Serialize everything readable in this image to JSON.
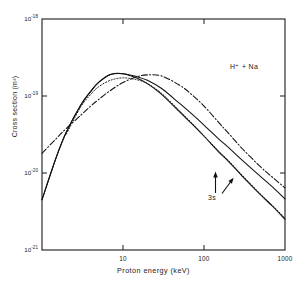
{
  "chart_data": {
    "type": "line",
    "title": "",
    "xlabel": "Proton energy (keV)",
    "ylabel": "Cross section (m²)",
    "xscale": "log",
    "yscale": "log",
    "xlim": [
      1,
      1000
    ],
    "ylim": [
      1e-21,
      1e-18
    ],
    "grid": false,
    "legend": "none",
    "xticks": [
      {
        "value": 10,
        "label": "10"
      },
      {
        "value": 100,
        "label": "100"
      },
      {
        "value": 1000,
        "label": "1000"
      }
    ],
    "yticks": [
      {
        "value": 1e-18,
        "mantissa": "10",
        "exponent": "-18"
      },
      {
        "value": 1e-19,
        "mantissa": "10",
        "exponent": "-19"
      },
      {
        "value": 1e-20,
        "mantissa": "10",
        "exponent": "-20"
      },
      {
        "value": 1e-21,
        "mantissa": "10",
        "exponent": "-21"
      }
    ],
    "annotations": [
      {
        "name": "reaction-label",
        "text": "H⁺ + Na",
        "x": 230,
        "y": 63
      },
      {
        "name": "state-label",
        "text": "3s",
        "x": 180,
        "y": 300
      }
    ],
    "series": [
      {
        "name": "solid-curve-1",
        "style": "solid",
        "x": [
          1,
          1.5,
          2,
          3,
          4,
          5,
          7,
          10,
          15,
          20,
          30,
          50,
          70,
          100,
          150,
          200,
          300,
          500,
          700,
          1000
        ],
        "y": [
          4.5e-21,
          1.6e-20,
          3.4e-20,
          7.6e-20,
          1.15e-19,
          1.5e-19,
          1.9e-19,
          1.95e-19,
          1.7e-19,
          1.45e-19,
          1.05e-19,
          6.2e-20,
          4.4e-20,
          3e-20,
          1.9e-20,
          1.42e-20,
          9e-21,
          5.2e-21,
          3.7e-21,
          2.5e-21
        ]
      },
      {
        "name": "solid-curve-2",
        "style": "solid",
        "x": [
          1,
          1.5,
          2,
          3,
          4,
          5,
          7,
          10,
          15,
          20,
          30,
          50,
          70,
          100,
          150,
          200,
          300,
          500,
          700,
          1000
        ],
        "y": [
          4.5e-21,
          1.6e-20,
          3.4e-20,
          7.6e-20,
          1.15e-19,
          1.5e-19,
          1.9e-19,
          1.95e-19,
          1.78e-19,
          1.6e-19,
          1.25e-19,
          8e-20,
          5.9e-20,
          4.2e-20,
          2.8e-20,
          2.15e-20,
          1.45e-20,
          9e-21,
          6.6e-21,
          4.6e-21
        ]
      },
      {
        "name": "dotted-curve",
        "style": "dotted",
        "x": [
          2,
          3,
          4,
          5,
          7,
          10,
          15,
          20,
          30,
          50,
          70,
          100,
          150,
          200,
          300,
          500,
          700,
          1000
        ],
        "y": [
          3.2e-20,
          7.2e-20,
          1.05e-19,
          1.32e-19,
          1.6e-19,
          1.72e-19,
          1.62e-19,
          1.45e-19,
          1.08e-19,
          6.4e-20,
          4.5e-20,
          3.05e-20,
          1.95e-20,
          1.45e-20,
          9.2e-21,
          5.3e-21,
          3.8e-21,
          2.6e-21
        ]
      },
      {
        "name": "dash-dot-curve",
        "style": "dashdot",
        "x": [
          1,
          1.5,
          2,
          3,
          4,
          5,
          7,
          10,
          15,
          20,
          30,
          50,
          70,
          100,
          150,
          200,
          300,
          500,
          700,
          1000
        ],
        "y": [
          1.8e-20,
          2.8e-20,
          3.8e-20,
          5.6e-20,
          7.4e-20,
          9e-20,
          1.18e-19,
          1.5e-19,
          1.78e-19,
          1.88e-19,
          1.82e-19,
          1.38e-19,
          1.05e-19,
          7.4e-20,
          4.6e-20,
          3.3e-20,
          2.05e-20,
          1.2e-20,
          8.8e-21,
          6.4e-21
        ]
      }
    ]
  },
  "frame": {
    "left": 42,
    "right": 285,
    "top": 19,
    "bottom": 250
  }
}
